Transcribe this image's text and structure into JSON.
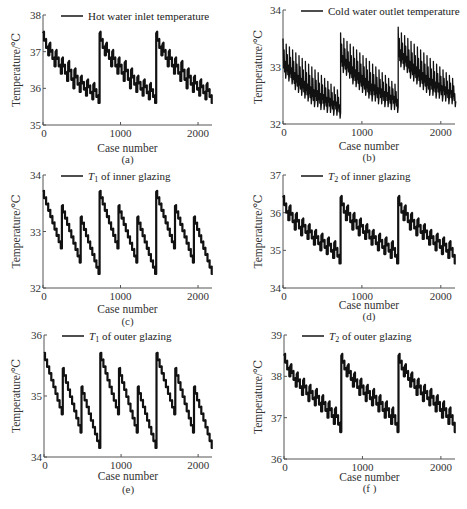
{
  "chart_data": [
    {
      "id": "a",
      "type": "line",
      "caption": "(a)",
      "legend": "Hot water inlet temperature",
      "legend_main": "Hot water inlet temperature",
      "legend_sub": "",
      "legend_suffix": "",
      "legend_placement": "top",
      "xlabel": "Case number",
      "ylabel": "Temperature/℃",
      "xlim": [
        0,
        2200
      ],
      "ylim": [
        35,
        38
      ],
      "xticks": [
        0,
        1000,
        2000
      ],
      "yticks": [
        35,
        36,
        37,
        38
      ],
      "grid": false,
      "cycle_length": 730,
      "sub_cycles": 9,
      "cycle_start_values": [
        37.5,
        37.2,
        37.0,
        36.8,
        36.7,
        36.5,
        36.3,
        36.2,
        36.1
      ],
      "cycle_end_values": [
        36.9,
        36.6,
        36.4,
        36.2,
        36.0,
        35.9,
        35.8,
        35.7,
        35.6
      ],
      "ripple": 0.3
    },
    {
      "id": "b",
      "type": "line",
      "caption": "(b)",
      "legend_main": "Cold water outlet temperature",
      "legend_sub": "",
      "legend_suffix": "",
      "legend_placement": "top",
      "xlabel": "Case number",
      "ylabel": "Temperature/℃",
      "xlim": [
        0,
        2200
      ],
      "ylim": [
        32,
        34
      ],
      "xticks": [
        0,
        1000,
        2000
      ],
      "yticks": [
        32,
        33,
        34
      ],
      "grid": false,
      "cycle_length": 730,
      "sub_cycles": 18,
      "cycle_start_values": [
        33.5,
        33.4,
        33.35,
        33.3,
        33.25,
        33.2,
        33.15,
        33.1,
        33.05,
        33.0,
        32.95,
        32.9,
        32.85,
        32.8,
        32.75,
        32.7,
        32.65,
        32.6
      ],
      "cycle_end_values": [
        32.9,
        32.85,
        32.8,
        32.7,
        32.65,
        32.6,
        32.55,
        32.5,
        32.45,
        32.4,
        32.4,
        32.35,
        32.35,
        32.3,
        32.3,
        32.25,
        32.25,
        32.2
      ],
      "cycle_offsets": [
        0,
        0.1,
        0.2
      ],
      "ripple": 0.5
    },
    {
      "id": "c",
      "type": "line",
      "caption": "(c)",
      "legend_main": "T",
      "legend_sub": "1",
      "legend_suffix": " of inner glazing",
      "legend_placement": "top",
      "xlabel": "Case number",
      "ylabel": "Temperature/℃",
      "xlim": [
        0,
        2200
      ],
      "ylim": [
        32,
        34
      ],
      "xticks": [
        0,
        1000,
        2000
      ],
      "yticks": [
        32,
        33,
        34
      ],
      "grid": false,
      "cycle_length": 730,
      "sub_cycles": 3,
      "cycle_start_values": [
        33.7,
        33.45,
        33.25
      ],
      "cycle_end_values": [
        32.7,
        32.45,
        32.25
      ],
      "ripple": 0.12
    },
    {
      "id": "d",
      "type": "line",
      "caption": "(d)",
      "legend_main": "T",
      "legend_sub": "2",
      "legend_suffix": " of inner glazing",
      "legend_placement": "top",
      "xlabel": "Case number",
      "ylabel": "Temperature/℃",
      "xlim": [
        0,
        2200
      ],
      "ylim": [
        34,
        37
      ],
      "xticks": [
        0,
        1000,
        2000
      ],
      "yticks": [
        34,
        35,
        36,
        37
      ],
      "grid": false,
      "cycle_length": 730,
      "sub_cycles": 9,
      "cycle_start_values": [
        36.4,
        36.15,
        35.95,
        35.8,
        35.65,
        35.5,
        35.4,
        35.3,
        35.2
      ],
      "cycle_end_values": [
        35.8,
        35.55,
        35.4,
        35.3,
        35.15,
        35.0,
        34.9,
        34.8,
        34.65
      ],
      "ripple": 0.3
    },
    {
      "id": "e",
      "type": "line",
      "caption": "(e)",
      "legend_main": "T",
      "legend_sub": "1",
      "legend_suffix": " of outer glazing",
      "legend_placement": "top",
      "xlabel": "Case number",
      "ylabel": "Temperature/℃",
      "xlim": [
        0,
        2200
      ],
      "ylim": [
        34,
        36
      ],
      "xticks": [
        0,
        1000,
        2000
      ],
      "yticks": [
        34,
        35,
        36
      ],
      "grid": false,
      "cycle_length": 730,
      "sub_cycles": 3,
      "cycle_start_values": [
        35.7,
        35.45,
        35.15
      ],
      "cycle_end_values": [
        34.7,
        34.4,
        34.15
      ],
      "ripple": 0.06
    },
    {
      "id": "f",
      "type": "line",
      "caption": "(f )",
      "legend_main": "T",
      "legend_sub": "2",
      "legend_suffix": " of outer glazing",
      "legend_placement": "top",
      "xlabel": "Case number",
      "ylabel": "Temperature/℃",
      "xlim": [
        0,
        2200
      ],
      "ylim": [
        36,
        39
      ],
      "xticks": [
        0,
        1000,
        2000
      ],
      "yticks": [
        36,
        37,
        38,
        39
      ],
      "grid": false,
      "cycle_length": 730,
      "sub_cycles": 9,
      "cycle_start_values": [
        38.5,
        38.25,
        38.05,
        37.9,
        37.75,
        37.65,
        37.5,
        37.35,
        37.2
      ],
      "cycle_end_values": [
        38.0,
        37.75,
        37.55,
        37.4,
        37.3,
        37.15,
        37.0,
        36.85,
        36.65
      ],
      "ripple": 0.3
    }
  ]
}
